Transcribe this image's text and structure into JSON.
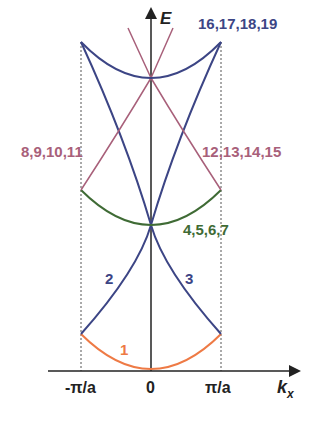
{
  "diagram": {
    "axes": {
      "y_label": "E",
      "x_label_main": "k",
      "x_label_sub": "x",
      "x_ticks": [
        "-π/a",
        "0",
        "π/a"
      ]
    },
    "bands": [
      {
        "id": "band-1",
        "label": "1",
        "color": "#ee7a45"
      },
      {
        "id": "band-2",
        "label": "2",
        "color": "#3c4585"
      },
      {
        "id": "band-3",
        "label": "3",
        "color": "#3c4585"
      },
      {
        "id": "band-4-7",
        "label": "4,5,6,7",
        "color": "#3f6b35"
      },
      {
        "id": "band-8-11",
        "label": "8,9,10,11",
        "color": "#a8607a"
      },
      {
        "id": "band-12-15",
        "label": "12,13,14,15",
        "color": "#a8607a"
      },
      {
        "id": "band-16-19",
        "label": "16,17,18,19",
        "color": "#3c4585"
      }
    ],
    "colors": {
      "axis": "#222222",
      "blue": "#3c4585",
      "pink": "#a8607a",
      "green": "#3f6b35",
      "orange": "#ee7a45",
      "dashed": "#555555"
    }
  }
}
